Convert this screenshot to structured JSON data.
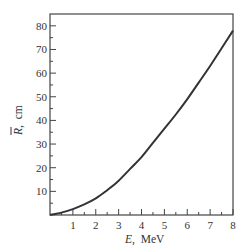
{
  "chart_data": {
    "type": "line",
    "title": "",
    "xlabel": "E,  MeV",
    "ylabel": "R, cm",
    "ylabel_symbol": "R",
    "ylabel_has_overbar": true,
    "ylabel_unit": "cm",
    "xlabel_symbol": "E,",
    "xlabel_unit": "MeV",
    "xlim": [
      0,
      8
    ],
    "ylim": [
      0,
      85
    ],
    "x_ticks": [
      1,
      2,
      3,
      4,
      5,
      6,
      7,
      8
    ],
    "x_tick_labels": [
      "1",
      "2",
      "3",
      "4",
      "5",
      "6",
      "7",
      "8"
    ],
    "x_minor_ticks": [
      0.5,
      1.5,
      2.5,
      3.5,
      4.5,
      5.5,
      6.5,
      7.5
    ],
    "y_ticks": [
      10,
      20,
      30,
      40,
      50,
      60,
      70,
      80
    ],
    "y_tick_labels": [
      "10",
      "20",
      "30",
      "40",
      "50",
      "60",
      "70",
      "80"
    ],
    "y_minor_ticks": [
      5,
      15,
      25,
      35,
      45,
      55,
      65,
      75
    ],
    "grid": false,
    "legend": null,
    "series": [
      {
        "name": "Mean range vs energy",
        "x": [
          0,
          0.5,
          1,
          1.5,
          2,
          2.5,
          3,
          3.5,
          4,
          4.5,
          5,
          5.5,
          6,
          6.5,
          7,
          7.5,
          8
        ],
        "values": [
          0,
          1.0,
          2.5,
          4.5,
          7.0,
          10.5,
          14.5,
          19.5,
          24.5,
          30.5,
          36.5,
          42.5,
          49.0,
          56.0,
          63.0,
          70.5,
          78.0
        ]
      }
    ],
    "colors": {
      "line": "#333333",
      "axis": "#444444",
      "background": "#ffffff"
    }
  }
}
